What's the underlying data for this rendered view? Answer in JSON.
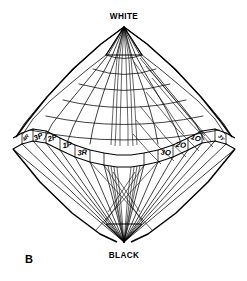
{
  "figure": {
    "id": "B",
    "caption_label": "B",
    "type": "color-solid-double-cone",
    "apex_top_label": "WHITE",
    "apex_bottom_label": "BLACK",
    "line_color": "#000000",
    "background_color": "#ffffff"
  },
  "hue_labels": {
    "front_left": [
      {
        "text": "4R",
        "note": "edge, foreshortened"
      },
      {
        "text": "3P"
      },
      {
        "text": "2P"
      },
      {
        "text": "1P"
      },
      {
        "text": "3R"
      }
    ],
    "front_right": [
      {
        "text": "3O"
      },
      {
        "text": "2O"
      },
      {
        "text": "1O"
      },
      {
        "text": "3Y",
        "note": "edge, foreshortened"
      }
    ]
  },
  "axis": {
    "top": "WHITE",
    "bottom": "BLACK"
  },
  "geometry": {
    "apex_top": {
      "x": 124,
      "y": 27
    },
    "apex_bottom": {
      "x": 124,
      "y": 242
    },
    "left_extent_x": 13,
    "right_extent_x": 236,
    "equator_y": 143
  }
}
